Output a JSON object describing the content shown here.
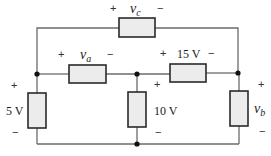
{
  "diagram": {
    "type": "circuit",
    "elements": [
      {
        "id": "vc",
        "label_var": "v",
        "label_sub": "c",
        "plus": "+",
        "minus": "−",
        "orientation": "horizontal",
        "position": "top"
      },
      {
        "id": "va",
        "label_var": "v",
        "label_sub": "a",
        "plus": "+",
        "minus": "−",
        "orientation": "horizontal",
        "position": "middle-left"
      },
      {
        "id": "e15",
        "label": "15 V",
        "plus": "+",
        "minus": "−",
        "orientation": "horizontal",
        "position": "middle-right"
      },
      {
        "id": "e5",
        "label": "5 V",
        "plus": "+",
        "minus": "−",
        "orientation": "vertical",
        "position": "left"
      },
      {
        "id": "e10",
        "label": "10 V",
        "plus": "+",
        "minus": "−",
        "orientation": "vertical",
        "position": "center"
      },
      {
        "id": "vb",
        "label_var": "v",
        "label_sub": "b",
        "plus": "+",
        "minus": "−",
        "orientation": "vertical",
        "position": "right"
      }
    ],
    "nodes": 4,
    "colors": {
      "wire": "#6b6b6b",
      "component_fill": "#ececec",
      "component_stroke": "#2a2a2a",
      "node": "#111111"
    }
  }
}
